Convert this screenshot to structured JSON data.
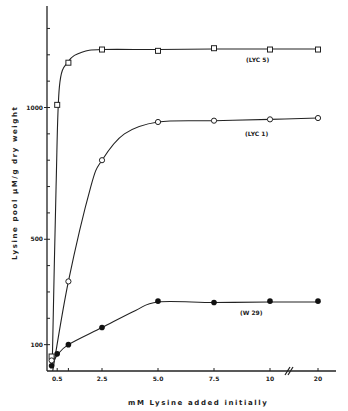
{
  "chart_data": {
    "type": "line",
    "title": "",
    "xlabel": "mM Lysine added initially",
    "ylabel": "Lysine pool µM/g dry weight",
    "x_ticks": [
      {
        "value": 0.5,
        "label": "0.5"
      },
      {
        "value": 1.0,
        "label": ""
      },
      {
        "value": 2.5,
        "label": "2.5"
      },
      {
        "value": 5.0,
        "label": "5.0"
      },
      {
        "value": 7.5,
        "label": "7.5"
      },
      {
        "value": 10,
        "label": "10"
      },
      {
        "value": 20,
        "label": "20"
      }
    ],
    "y_ticks": [
      {
        "value": 100,
        "label": "100"
      },
      {
        "value": 500,
        "label": "500"
      },
      {
        "value": 1000,
        "label": "1000"
      }
    ],
    "y_minor_step": 100,
    "ylim": [
      0,
      1350
    ],
    "x_axis_break": "between 10 and 20",
    "grid": false,
    "legend": "inline labels on curves",
    "series": [
      {
        "name": "LYC 5",
        "marker": "open-square",
        "x": [
          0.25,
          0.5,
          1.0,
          2.5,
          5.0,
          7.5,
          10,
          20
        ],
        "values": [
          55,
          1010,
          1170,
          1220,
          1215,
          1225,
          1220,
          1220
        ]
      },
      {
        "name": "LYC 1",
        "marker": "open-circle",
        "x": [
          0.25,
          1.0,
          2.5,
          5.0,
          7.5,
          10,
          20
        ],
        "values": [
          40,
          340,
          800,
          945,
          950,
          955,
          960
        ]
      },
      {
        "name": "W 29",
        "marker": "filled-circle",
        "x": [
          0.25,
          0.5,
          1.0,
          2.5,
          5.0,
          7.5,
          10,
          20
        ],
        "values": [
          20,
          65,
          100,
          165,
          265,
          260,
          265,
          265
        ]
      }
    ]
  },
  "labels": {
    "x_axis_title": "mM  Lysine  added  initially",
    "y_axis_title": "Lysine   pool   µM/g   dry   weight",
    "series_tags": [
      "(LYC 5)",
      "(LYC 1)",
      "(W 29)"
    ]
  }
}
